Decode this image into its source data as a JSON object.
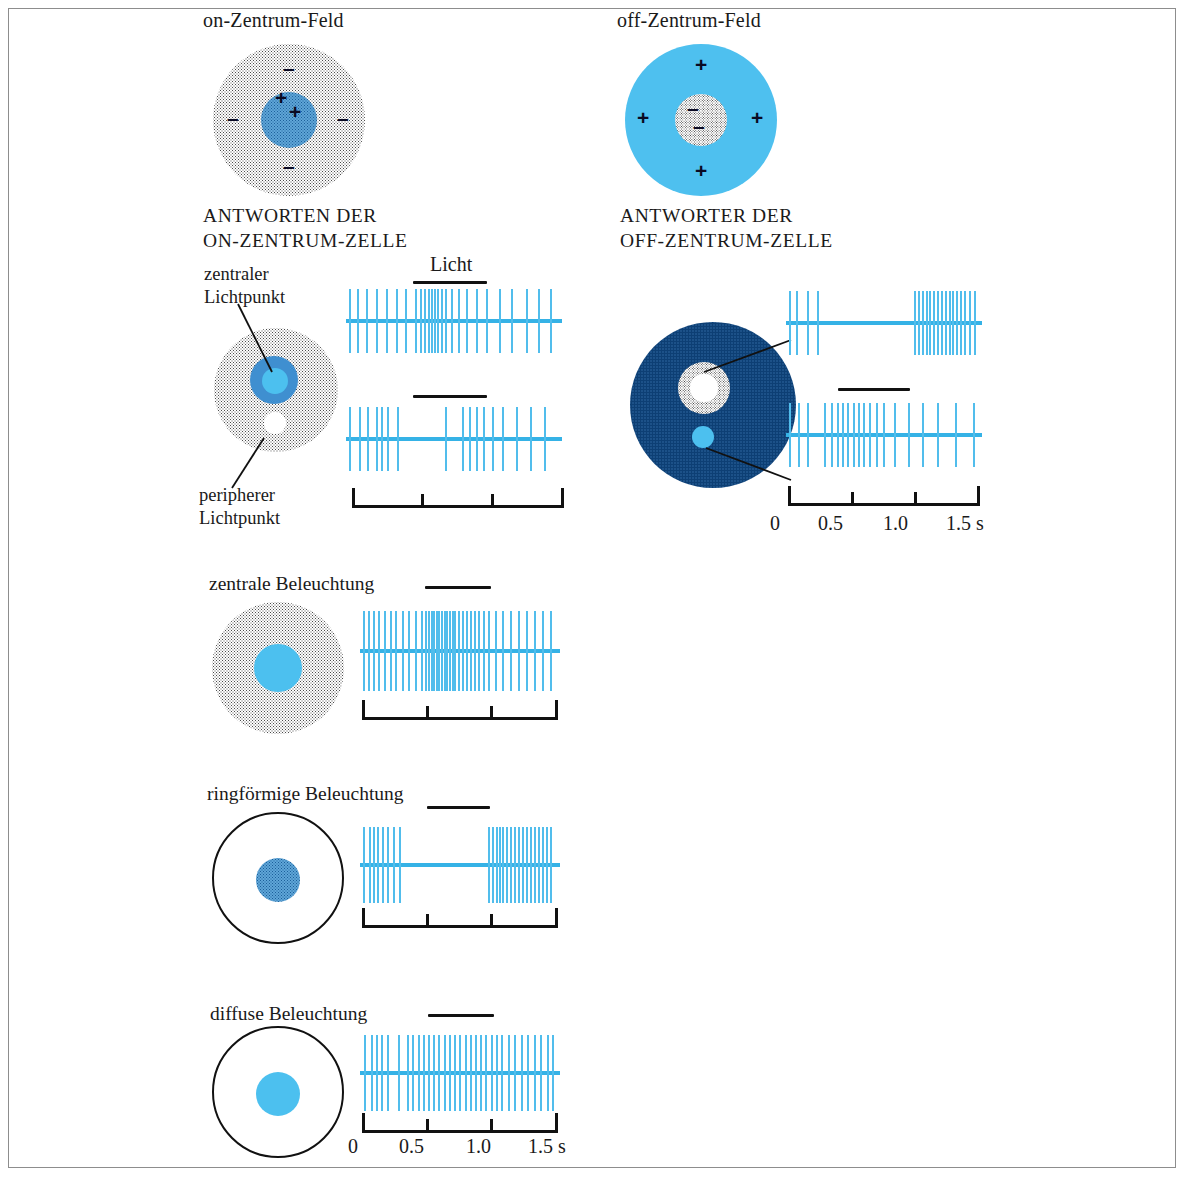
{
  "figure": {
    "title_left": "on-Zentrum-Feld",
    "title_right": "off-Zentrum-Feld",
    "heading_left": "ANTWORTEN DER\nON-ZENTRUM-ZELLE",
    "heading_right": "ANTWORTER DER\nOFF-ZENTRUM-ZELLE",
    "light_label": "Licht",
    "accent_blue": "#39b4e8",
    "spike_blue": "#51bdec",
    "dark_blue": "#0d3f74",
    "ink": "#111111"
  },
  "field_diagrams": {
    "on_center": {
      "name": "on-Zentrum-Feld",
      "center_sign": "+",
      "center_signs": [
        "+",
        "+"
      ],
      "surround_signs": [
        "–",
        "–",
        "–",
        "–"
      ]
    },
    "off_center": {
      "name": "off-Zentrum-Feld",
      "center_signs": [
        "–",
        "–"
      ],
      "surround_signs": [
        "+",
        "+",
        "+",
        "+"
      ]
    }
  },
  "labels": {
    "zentraler_lichtpunkt": "zentraler\nLichtpunkt",
    "peripherer_lichtpunkt": "peripherer\nLichtpunkt",
    "zentrale_beleuchtung": "zentrale Beleuchtung",
    "ringfoermige_beleuchtung": "ringförmige Beleuchtung",
    "diffuse_beleuchtung": "diffuse Beleuchtung"
  },
  "time_axis": {
    "ticks": [
      "0",
      "0.5",
      "1.0",
      "1.5 s"
    ],
    "values": [
      0,
      0.5,
      1.0,
      1.5
    ],
    "unit": "s",
    "range": [
      0,
      1.5
    ]
  },
  "chart_data": {
    "type": "scatter",
    "xlabel": "Zeit (s)",
    "ylabel": "",
    "xlim": [
      0,
      1.5
    ],
    "grid": false,
    "legend": "none",
    "stimulus_bar": {
      "start": 0.5,
      "end": 1.0,
      "label": "Licht"
    },
    "panels": [
      {
        "cell": "on-Zentrum-Zelle",
        "stimulus": "zentraler Lichtpunkt",
        "response": "Erregung während der Belichtung",
        "spike_times": [
          0.02,
          0.08,
          0.14,
          0.21,
          0.28,
          0.35,
          0.42,
          0.49,
          0.52,
          0.55,
          0.58,
          0.6,
          0.62,
          0.64,
          0.67,
          0.7,
          0.74,
          0.79,
          0.85,
          0.92,
          0.99,
          1.08,
          1.17,
          1.27,
          1.36,
          1.44
        ]
      },
      {
        "cell": "on-Zentrum-Zelle",
        "stimulus": "peripherer Lichtpunkt",
        "response": "Hemmung während der Belichtung, Nachentladung",
        "spike_times": [
          0.02,
          0.09,
          0.15,
          0.21,
          0.25,
          0.29,
          0.36,
          0.7,
          0.82,
          0.87,
          0.92,
          0.97,
          1.03,
          1.1,
          1.2,
          1.3,
          1.4
        ]
      },
      {
        "cell": "on-Zentrum-Zelle",
        "stimulus": "zentrale Beleuchtung",
        "response": "starke Erregung während der Belichtung",
        "spike_times": [
          0.02,
          0.06,
          0.1,
          0.14,
          0.18,
          0.23,
          0.27,
          0.32,
          0.37,
          0.42,
          0.47,
          0.5,
          0.52,
          0.54,
          0.56,
          0.58,
          0.6,
          0.62,
          0.64,
          0.66,
          0.68,
          0.7,
          0.72,
          0.75,
          0.78,
          0.81,
          0.84,
          0.87,
          0.9,
          0.94,
          0.98,
          1.03,
          1.09,
          1.15,
          1.21,
          1.27,
          1.33,
          1.39,
          1.45
        ]
      },
      {
        "cell": "on-Zentrum-Zelle",
        "stimulus": "ringförmige Beleuchtung",
        "response": "Hemmung während der Belichtung, kräftige Nachentladung",
        "spike_times": [
          0.02,
          0.07,
          0.1,
          0.13,
          0.17,
          0.21,
          0.25,
          0.3,
          0.98,
          1.01,
          1.04,
          1.06,
          1.09,
          1.12,
          1.15,
          1.18,
          1.21,
          1.24,
          1.27,
          1.3,
          1.33,
          1.36,
          1.39,
          1.42,
          1.45
        ]
      },
      {
        "cell": "on-Zentrum-Zelle",
        "stimulus": "diffuse Beleuchtung",
        "response": "schwache, gleichmäßige Antwort",
        "spike_times": [
          0.03,
          0.08,
          0.12,
          0.16,
          0.21,
          0.29,
          0.36,
          0.4,
          0.44,
          0.48,
          0.52,
          0.56,
          0.6,
          0.64,
          0.68,
          0.72,
          0.76,
          0.8,
          0.84,
          0.88,
          0.92,
          0.96,
          1.0,
          1.04,
          1.08,
          1.13,
          1.18,
          1.23,
          1.28,
          1.33,
          1.38,
          1.43,
          1.47
        ]
      },
      {
        "cell": "off-Zentrum-Zelle",
        "stimulus": "zentraler Lichtpunkt",
        "response": "Hemmung während der Belichtung, starke Nachentladung",
        "spike_times": [
          0.02,
          0.08,
          0.16,
          0.24,
          1.0,
          1.03,
          1.06,
          1.09,
          1.12,
          1.15,
          1.18,
          1.21,
          1.24,
          1.27,
          1.3,
          1.33,
          1.36,
          1.39,
          1.43,
          1.47
        ]
      },
      {
        "cell": "off-Zentrum-Zelle",
        "stimulus": "peripherer Lichtpunkt",
        "response": "Erregung während der Belichtung",
        "spike_times": [
          0.02,
          0.09,
          0.16,
          0.3,
          0.35,
          0.4,
          0.44,
          0.48,
          0.52,
          0.56,
          0.6,
          0.65,
          0.7,
          0.76,
          0.84,
          0.95,
          1.06,
          1.18,
          1.32,
          1.46
        ]
      }
    ]
  }
}
